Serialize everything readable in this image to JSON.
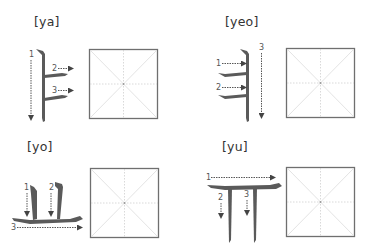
{
  "colors": {
    "stroke": "#5a5a5a",
    "guide_arrow": "#444444",
    "box_border": "#6f6f6f",
    "grid_line": "#d6d6d6",
    "label_text": "#333333"
  },
  "cells": [
    {
      "id": "ya",
      "label": "[ya]",
      "character": "ㅑ",
      "strokes": [
        {
          "number": "1",
          "direction": "down"
        },
        {
          "number": "2",
          "direction": "right"
        },
        {
          "number": "3",
          "direction": "right"
        }
      ]
    },
    {
      "id": "yeo",
      "label": "[yeo]",
      "character": "ㅕ",
      "strokes": [
        {
          "number": "1",
          "direction": "right"
        },
        {
          "number": "2",
          "direction": "right"
        },
        {
          "number": "3",
          "direction": "down"
        }
      ]
    },
    {
      "id": "yo",
      "label": "[yo]",
      "character": "ㅛ",
      "strokes": [
        {
          "number": "1",
          "direction": "down"
        },
        {
          "number": "2",
          "direction": "down"
        },
        {
          "number": "3",
          "direction": "right"
        }
      ]
    },
    {
      "id": "yu",
      "label": "[yu]",
      "character": "ㅠ",
      "strokes": [
        {
          "number": "1",
          "direction": "right"
        },
        {
          "number": "2",
          "direction": "down"
        },
        {
          "number": "3",
          "direction": "down"
        }
      ]
    }
  ]
}
